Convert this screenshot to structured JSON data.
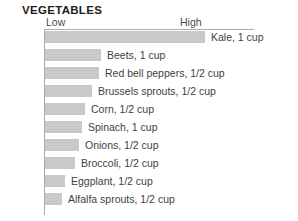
{
  "chart_title": "VEGETABLES",
  "axis": {
    "low_label": "Low",
    "high_label": "High"
  },
  "colors": {
    "bar_fill": "#c9c9c9",
    "axis_rule": "#a8a8a8",
    "title_text": "#1d1d1d",
    "label_text": "#3f3f3f",
    "background": "#ffffff"
  },
  "chart_data": {
    "type": "bar",
    "orientation": "horizontal",
    "title": "VEGETABLES",
    "xlabel": "",
    "ylabel": "",
    "grid": false,
    "legend": false,
    "axis_tick_labels": [
      "Low",
      "High"
    ],
    "xlim": [
      0,
      100
    ],
    "value_unit": "relative scale (Low to High)",
    "categories": [
      "Kale, 1 cup",
      "Beets, 1 cup",
      "Red bell peppers, 1/2 cup",
      "Brussels sprouts, 1/2 cup",
      "Corn, 1/2 cup",
      "Spinach, 1 cup",
      "Onions, 1/2 cup",
      "Broccoli, 1/2 cup",
      "Eggplant, 1/2 cup",
      "Alfalfa sprouts, 1/2 cup"
    ],
    "values": [
      100,
      40,
      39,
      34,
      29,
      27,
      25,
      22,
      15,
      12
    ],
    "bars": [
      {
        "label": "Kale, 1 cup",
        "value": 100,
        "width_px": 160
      },
      {
        "label": "Beets, 1 cup",
        "value": 40,
        "width_px": 56
      },
      {
        "label": "Red bell peppers, 1/2 cup",
        "value": 39,
        "width_px": 54
      },
      {
        "label": "Brussels sprouts, 1/2 cup",
        "value": 34,
        "width_px": 47
      },
      {
        "label": "Corn, 1/2 cup",
        "value": 29,
        "width_px": 40
      },
      {
        "label": "Spinach, 1 cup",
        "value": 27,
        "width_px": 37
      },
      {
        "label": "Onions, 1/2 cup",
        "value": 25,
        "width_px": 34
      },
      {
        "label": "Broccoli, 1/2 cup",
        "value": 22,
        "width_px": 30
      },
      {
        "label": "Eggplant, 1/2 cup",
        "value": 15,
        "width_px": 20
      },
      {
        "label": "Alfalfa sprouts, 1/2 cup",
        "value": 12,
        "width_px": 17
      }
    ]
  }
}
